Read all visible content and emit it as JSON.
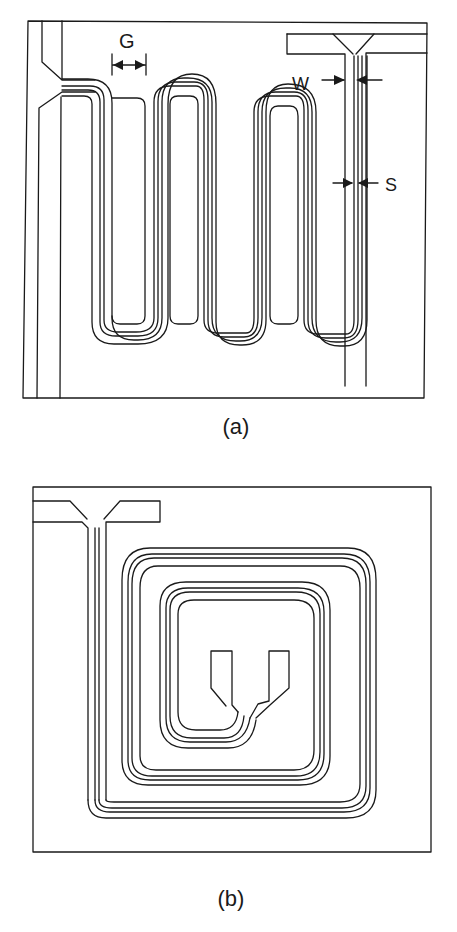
{
  "figure": {
    "panels": [
      {
        "id": "a",
        "caption": "(a)",
        "description": "Meander-line coplanar waveguide resonator",
        "dimension_labels": {
          "gap": "G",
          "width": "W",
          "spacing": "S"
        }
      },
      {
        "id": "b",
        "caption": "(b)",
        "description": "Spiral coplanar waveguide resonator"
      }
    ],
    "colors": {
      "line": "#1a1a1a",
      "background": "#ffffff"
    }
  }
}
